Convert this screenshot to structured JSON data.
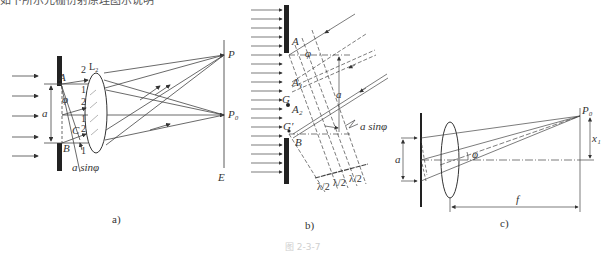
{
  "top_text": "如下所示光栅衍射原理图示说明",
  "figure_caption": "图 2-3-7",
  "panels": {
    "a": {
      "caption": "a)",
      "labels": {
        "lens": "L₂",
        "point_p": "P",
        "point_p0": "P₀",
        "screen": "E",
        "edge_a": "A",
        "edge_b": "B",
        "point_c": "C",
        "width": "a",
        "angle": "φ",
        "path_diff": "a sinφ",
        "ray_2a": "2",
        "ray_1a": "1",
        "ray_2b": "2",
        "ray_1b": "1",
        "ray_2c": "2",
        "ray_1c": "1"
      }
    },
    "b": {
      "caption": "b)",
      "labels": {
        "edge_a": "A",
        "a1": "A₁",
        "a2": "A₂",
        "g": "G",
        "g_prime": "G′",
        "edge_b": "B",
        "angle": "φ",
        "width": "a",
        "path_diff": "a sinφ",
        "half_wave_1": "λ/2",
        "half_wave_2": "λ/2",
        "half_wave_3": "λ/2"
      }
    },
    "c": {
      "caption": "c)",
      "labels": {
        "point_p0": "P₀",
        "width": "a",
        "offset": "x₁",
        "angle": "φ",
        "focal": "f"
      }
    }
  }
}
